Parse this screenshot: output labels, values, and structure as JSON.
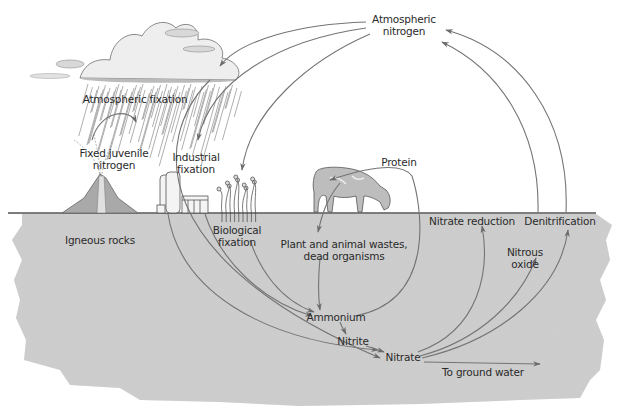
{
  "labels": {
    "atmospheric_nitrogen": [
      "Atmospheric",
      "nitrogen"
    ],
    "atmospheric_fixation": "Atmospheric fixation",
    "fixed_juvenile_nitrogen": [
      "Fixed juvenile",
      "nitrogen"
    ],
    "industrial_fixation": [
      "Industrial",
      "fixation"
    ],
    "biological_fixation": [
      "Biological",
      "fixation"
    ],
    "igneous_rocks": "Igneous rocks",
    "protein": "Protein",
    "plant_animal_wastes": [
      "Plant and animal wastes,",
      "dead organisms"
    ],
    "nitrate_reduction": "Nitrate reduction",
    "denitrification": "Denitrification",
    "nitrous_oxide": [
      "Nitrous",
      "oxide"
    ],
    "ammonium": "Ammonium",
    "nitrite": "Nitrite",
    "nitrate": "Nitrate",
    "to_ground_water": "To ground water"
  },
  "flows": [
    {
      "from": "Atmospheric nitrogen",
      "to": "Atmospheric fixation"
    },
    {
      "from": "Atmospheric nitrogen",
      "to": "Industrial fixation"
    },
    {
      "from": "Atmospheric nitrogen",
      "to": "Biological fixation"
    },
    {
      "from": "Atmospheric fixation",
      "to": "Nitrate"
    },
    {
      "from": "Fixed juvenile nitrogen",
      "to": "Atmospheric fixation"
    },
    {
      "from": "Industrial fixation",
      "to": "Ammonium"
    },
    {
      "from": "Industrial fixation",
      "to": "Nitrate"
    },
    {
      "from": "Biological fixation",
      "to": "Ammonium"
    },
    {
      "from": "Protein",
      "to": "Plant and animal wastes, dead organisms"
    },
    {
      "from": "Plant and animal wastes, dead organisms",
      "to": "Ammonium"
    },
    {
      "from": "Ammonium",
      "to": "Nitrite"
    },
    {
      "from": "Nitrite",
      "to": "Nitrate"
    },
    {
      "from": "Ammonium",
      "to": "Protein"
    },
    {
      "from": "Nitrate",
      "to": "Nitrate reduction"
    },
    {
      "from": "Nitrate",
      "to": "Nitrous oxide"
    },
    {
      "from": "Nitrate",
      "to": "Denitrification"
    },
    {
      "from": "Nitrate",
      "to": "To ground water"
    },
    {
      "from": "Nitrate reduction",
      "to": "Atmospheric nitrogen"
    },
    {
      "from": "Denitrification",
      "to": "Atmospheric nitrogen"
    }
  ],
  "colors": {
    "line": "#707070",
    "soil": "#cfcfcf",
    "soil_dark": "#b8b8b8",
    "ground_line": "#555555",
    "text": "#2a2a2a"
  }
}
